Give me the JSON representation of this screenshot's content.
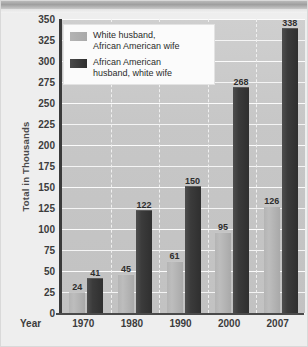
{
  "chart_data": {
    "type": "bar",
    "title": "",
    "xlabel": "Year",
    "ylabel": "Total in Thousands",
    "ylim": [
      0,
      350
    ],
    "ytick_step": 25,
    "grid": true,
    "legend_position": "top-left",
    "categories": [
      "1970",
      "1980",
      "1990",
      "2000",
      "2007"
    ],
    "yticks": [
      "350",
      "325",
      "300",
      "275",
      "250",
      "225",
      "200",
      "175",
      "150",
      "125",
      "100",
      "75",
      "50",
      "25",
      "0"
    ],
    "series": [
      {
        "name": "White husband,\nAfrican American wife",
        "color": "#b4b4b4",
        "values": [
          24,
          45,
          61,
          95,
          126
        ]
      },
      {
        "name": "African American\nhusband, white wife",
        "color": "#333333",
        "values": [
          41,
          122,
          150,
          268,
          338
        ]
      }
    ]
  },
  "legend": {
    "entries": [
      {
        "label": "White husband,\nAfrican American wife"
      },
      {
        "label": "African American\nhusband, white wife"
      }
    ]
  },
  "axes": {
    "y_title": "Total in Thousands",
    "x_title": "Year"
  },
  "colors": {
    "series_light": "#b4b4b4",
    "series_dark": "#333333",
    "plot_background": "#c7c7c7",
    "figure_background": "#eeeeee",
    "gridline": "#f6f6f6",
    "axis": "#3a3a3a"
  }
}
